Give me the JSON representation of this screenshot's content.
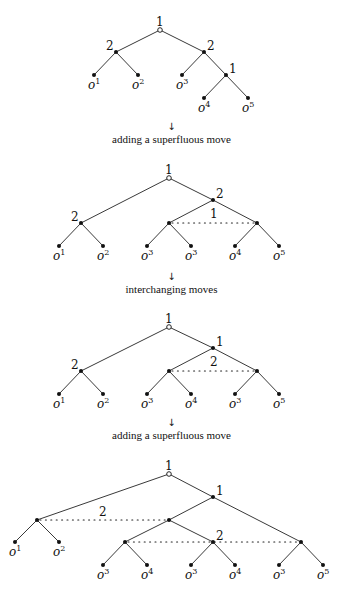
{
  "steps": [
    {
      "arrow": "↓",
      "caption": "adding a superfluous move"
    },
    {
      "arrow": "↓",
      "caption": "interchanging moves"
    },
    {
      "arrow": "↓",
      "caption": "adding a superfluous move"
    }
  ],
  "trees": [
    {
      "nodes": [
        {
          "id": "r",
          "x": 160,
          "y": 30,
          "type": "root",
          "label": "1",
          "lx": -4,
          "ly": -4
        },
        {
          "id": "a",
          "x": 116,
          "y": 52,
          "type": "dec",
          "label": "2",
          "lx": -10,
          "ly": -2
        },
        {
          "id": "b",
          "x": 204,
          "y": 52,
          "type": "dec",
          "label": "2",
          "lx": 3,
          "ly": -2
        },
        {
          "id": "c",
          "x": 226,
          "y": 75,
          "type": "dec",
          "label": "1",
          "lx": 3,
          "ly": -2
        },
        {
          "id": "l1",
          "x": 94,
          "y": 75,
          "type": "leaf",
          "outcome": "1"
        },
        {
          "id": "l2",
          "x": 138,
          "y": 75,
          "type": "leaf",
          "outcome": "2"
        },
        {
          "id": "l3",
          "x": 182,
          "y": 75,
          "type": "leaf",
          "outcome": "3"
        },
        {
          "id": "l4",
          "x": 204,
          "y": 98,
          "type": "leaf",
          "outcome": "4"
        },
        {
          "id": "l5",
          "x": 248,
          "y": 98,
          "type": "leaf",
          "outcome": "5"
        }
      ],
      "edges": [
        [
          "r",
          "a"
        ],
        [
          "r",
          "b"
        ],
        [
          "a",
          "l1"
        ],
        [
          "a",
          "l2"
        ],
        [
          "b",
          "l3"
        ],
        [
          "b",
          "c"
        ],
        [
          "c",
          "l4"
        ],
        [
          "c",
          "l5"
        ]
      ],
      "info_sets": []
    },
    {
      "nodes": [
        {
          "id": "r",
          "x": 169,
          "y": 178,
          "type": "root",
          "label": "1",
          "lx": -4,
          "ly": -4
        },
        {
          "id": "a",
          "x": 81,
          "y": 223,
          "type": "dec",
          "label": "2",
          "lx": -10,
          "ly": -2
        },
        {
          "id": "b",
          "x": 213,
          "y": 200,
          "type": "dec",
          "label": "2",
          "lx": 3,
          "ly": -2
        },
        {
          "id": "c",
          "x": 169,
          "y": 223,
          "type": "dec"
        },
        {
          "id": "d",
          "x": 257,
          "y": 223,
          "type": "dec"
        },
        {
          "id": "l1",
          "x": 59,
          "y": 246,
          "type": "leaf",
          "outcome": "1"
        },
        {
          "id": "l2",
          "x": 103,
          "y": 246,
          "type": "leaf",
          "outcome": "2"
        },
        {
          "id": "l3",
          "x": 147,
          "y": 246,
          "type": "leaf",
          "outcome": "3"
        },
        {
          "id": "l4",
          "x": 191,
          "y": 246,
          "type": "leaf",
          "outcome": "3"
        },
        {
          "id": "l5",
          "x": 235,
          "y": 246,
          "type": "leaf",
          "outcome": "4"
        },
        {
          "id": "l6",
          "x": 279,
          "y": 246,
          "type": "leaf",
          "outcome": "5"
        }
      ],
      "edges": [
        [
          "r",
          "a"
        ],
        [
          "r",
          "b"
        ],
        [
          "a",
          "l1"
        ],
        [
          "a",
          "l2"
        ],
        [
          "b",
          "c"
        ],
        [
          "b",
          "d"
        ],
        [
          "c",
          "l3"
        ],
        [
          "c",
          "l4"
        ],
        [
          "d",
          "l5"
        ],
        [
          "d",
          "l6"
        ]
      ],
      "info_sets": [
        {
          "from": "c",
          "to": "d",
          "label": "1",
          "lx": 210,
          "ly": 218
        }
      ]
    },
    {
      "nodes": [
        {
          "id": "r",
          "x": 169,
          "y": 327,
          "type": "root",
          "label": "1",
          "lx": -4,
          "ly": -4
        },
        {
          "id": "a",
          "x": 81,
          "y": 371,
          "type": "dec",
          "label": "2",
          "lx": -10,
          "ly": -2
        },
        {
          "id": "b",
          "x": 213,
          "y": 348,
          "type": "dec",
          "label": "1",
          "lx": 3,
          "ly": -2
        },
        {
          "id": "c",
          "x": 169,
          "y": 371,
          "type": "dec"
        },
        {
          "id": "d",
          "x": 257,
          "y": 371,
          "type": "dec"
        },
        {
          "id": "l1",
          "x": 59,
          "y": 394,
          "type": "leaf",
          "outcome": "1"
        },
        {
          "id": "l2",
          "x": 103,
          "y": 394,
          "type": "leaf",
          "outcome": "2"
        },
        {
          "id": "l3",
          "x": 147,
          "y": 394,
          "type": "leaf",
          "outcome": "3"
        },
        {
          "id": "l4",
          "x": 191,
          "y": 394,
          "type": "leaf",
          "outcome": "4"
        },
        {
          "id": "l5",
          "x": 235,
          "y": 394,
          "type": "leaf",
          "outcome": "3"
        },
        {
          "id": "l6",
          "x": 279,
          "y": 394,
          "type": "leaf",
          "outcome": "5"
        }
      ],
      "edges": [
        [
          "r",
          "a"
        ],
        [
          "r",
          "b"
        ],
        [
          "a",
          "l1"
        ],
        [
          "a",
          "l2"
        ],
        [
          "b",
          "c"
        ],
        [
          "b",
          "d"
        ],
        [
          "c",
          "l3"
        ],
        [
          "c",
          "l4"
        ],
        [
          "d",
          "l5"
        ],
        [
          "d",
          "l6"
        ]
      ],
      "info_sets": [
        {
          "from": "c",
          "to": "d",
          "label": "2",
          "lx": 210,
          "ly": 366
        }
      ]
    },
    {
      "nodes": [
        {
          "id": "r",
          "x": 169,
          "y": 474,
          "type": "root",
          "label": "1",
          "lx": -4,
          "ly": -4
        },
        {
          "id": "a",
          "x": 37,
          "y": 520,
          "type": "dec"
        },
        {
          "id": "b",
          "x": 213,
          "y": 497,
          "type": "dec",
          "label": "1",
          "lx": 3,
          "ly": -2
        },
        {
          "id": "c",
          "x": 169,
          "y": 520,
          "type": "dec"
        },
        {
          "id": "d",
          "x": 125,
          "y": 542,
          "type": "dec"
        },
        {
          "id": "e",
          "x": 213,
          "y": 542,
          "type": "dec",
          "label": "2",
          "lx": 3,
          "ly": -2
        },
        {
          "id": "f",
          "x": 301,
          "y": 542,
          "type": "dec"
        },
        {
          "id": "l1",
          "x": 15,
          "y": 542,
          "type": "leaf",
          "outcome": "1"
        },
        {
          "id": "l2",
          "x": 59,
          "y": 542,
          "type": "leaf",
          "outcome": "2"
        },
        {
          "id": "l3",
          "x": 103,
          "y": 565,
          "type": "leaf",
          "outcome": "3"
        },
        {
          "id": "l4",
          "x": 147,
          "y": 565,
          "type": "leaf",
          "outcome": "4"
        },
        {
          "id": "l5",
          "x": 191,
          "y": 565,
          "type": "leaf",
          "outcome": "3"
        },
        {
          "id": "l6",
          "x": 235,
          "y": 565,
          "type": "leaf",
          "outcome": "4"
        },
        {
          "id": "l7",
          "x": 279,
          "y": 565,
          "type": "leaf",
          "outcome": "3"
        },
        {
          "id": "l8",
          "x": 323,
          "y": 565,
          "type": "leaf",
          "outcome": "5"
        }
      ],
      "edges": [
        [
          "r",
          "a"
        ],
        [
          "r",
          "b"
        ],
        [
          "a",
          "l1"
        ],
        [
          "a",
          "l2"
        ],
        [
          "b",
          "c"
        ],
        [
          "b",
          "f"
        ],
        [
          "c",
          "d"
        ],
        [
          "c",
          "e"
        ],
        [
          "d",
          "l3"
        ],
        [
          "d",
          "l4"
        ],
        [
          "e",
          "l5"
        ],
        [
          "e",
          "l6"
        ],
        [
          "f",
          "l7"
        ],
        [
          "f",
          "l8"
        ]
      ],
      "info_sets": [
        {
          "from": "a",
          "to": "c",
          "label": "2",
          "lx": 99,
          "ly": 516
        },
        {
          "from": "d",
          "to": "f",
          "label": ""
        }
      ]
    }
  ],
  "layout": {
    "arrow_y": [
      121,
      271,
      417
    ],
    "caption_y": [
      133,
      283,
      429
    ]
  }
}
